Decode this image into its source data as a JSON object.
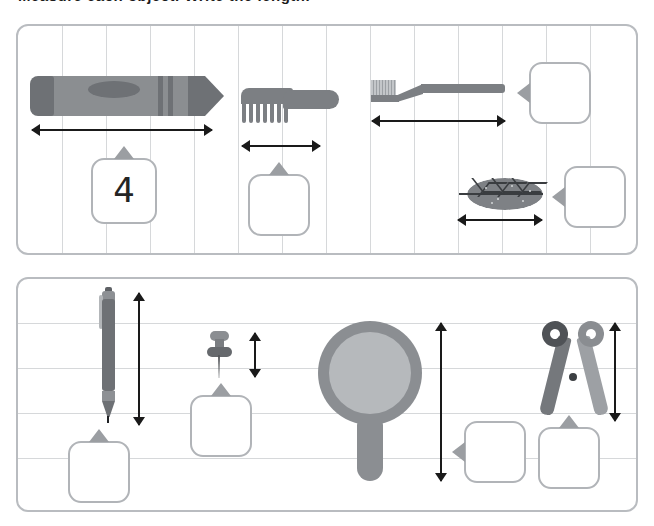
{
  "worksheet": {
    "heading": "Measure each object. Write the length.",
    "top_panel": {
      "name": "horizontal-measurement-panel",
      "grid": {
        "columns": 14,
        "rows": 1
      },
      "items": [
        {
          "id": "crayon",
          "object_label": "crayon",
          "orientation": "horizontal",
          "answer": "4",
          "answer_filled": true
        },
        {
          "id": "comb",
          "object_label": "comb",
          "orientation": "horizontal",
          "answer": "",
          "answer_filled": false
        },
        {
          "id": "toothbrush",
          "object_label": "toothbrush",
          "orientation": "horizontal",
          "answer": "",
          "answer_filled": false
        },
        {
          "id": "leaf",
          "object_label": "leaf",
          "orientation": "horizontal",
          "answer": "",
          "answer_filled": false
        }
      ]
    },
    "bottom_panel": {
      "name": "vertical-measurement-panel",
      "grid": {
        "columns": 1,
        "rows": 5
      },
      "items": [
        {
          "id": "pen",
          "object_label": "pen",
          "orientation": "vertical",
          "answer": "",
          "answer_filled": false
        },
        {
          "id": "thumbtack",
          "object_label": "thumbtack",
          "orientation": "vertical",
          "answer": "",
          "answer_filled": false
        },
        {
          "id": "magnifier",
          "object_label": "magnifying-glass",
          "orientation": "vertical",
          "answer": "",
          "answer_filled": false
        },
        {
          "id": "scissors",
          "object_label": "scissors",
          "orientation": "vertical",
          "answer": "",
          "answer_filled": false
        }
      ]
    },
    "colors": {
      "panel_border": "#b9bcc0",
      "grid_line": "#d6d8da",
      "object_gray": "#7c7f83",
      "object_dark": "#4f5256",
      "object_light": "#b6b9bc",
      "arrow": "#1a1a1a",
      "answer_box_border": "#b1b4b8",
      "answer_text": "#242424",
      "background": "#ffffff"
    }
  }
}
